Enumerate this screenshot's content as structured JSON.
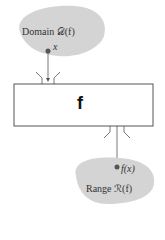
{
  "diagram": {
    "domain_label": "Domain 𝒟(f)",
    "input_label": "x",
    "function_label": "f",
    "output_label": "f(x)",
    "range_label": "Range ℛ(f)"
  },
  "colors": {
    "blob": "#d4d4d4",
    "line": "#555555",
    "dot": "#555555"
  }
}
